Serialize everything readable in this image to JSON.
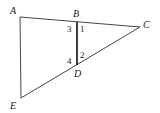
{
  "diagram": {
    "type": "geometry",
    "points": [
      {
        "name": "A",
        "label": "A"
      },
      {
        "name": "B",
        "label": "B"
      },
      {
        "name": "C",
        "label": "C"
      },
      {
        "name": "D",
        "label": "D"
      },
      {
        "name": "E",
        "label": "E"
      }
    ],
    "segments": [
      "AC",
      "AE",
      "EC",
      "BD"
    ],
    "angles": [
      {
        "label": "1",
        "at": "B",
        "between": "BD,BC"
      },
      {
        "label": "2",
        "at": "D",
        "between": "DB,DC"
      },
      {
        "label": "3",
        "at": "B",
        "between": "BA,BD"
      },
      {
        "label": "4",
        "at": "D",
        "between": "DB,DE"
      }
    ],
    "colors": {
      "line": "#333333",
      "segment_bd": "#111111"
    }
  }
}
